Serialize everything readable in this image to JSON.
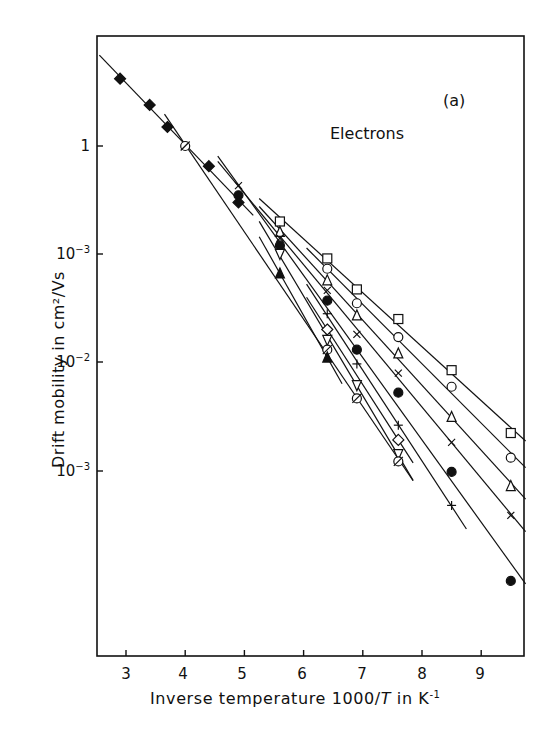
{
  "chart_data": {
    "type": "scatter",
    "title": "",
    "panel_label": "(a)",
    "annotation": "Electrons",
    "xlabel": "Inverse temperature 1000/T in K⁻¹",
    "ylabel": "Drift mobility in cm²/Vs",
    "x_ticks": [
      "3",
      "4",
      "5",
      "6",
      "7",
      "8",
      "9"
    ],
    "y_ticks": [
      "1",
      "10⁻³",
      "10⁻²",
      "10⁻³"
    ],
    "y_scale": "log",
    "xlim": [
      2.6,
      9.8
    ],
    "ylim": [
      3e-05,
      8
    ],
    "grid": false,
    "legend": "none",
    "series": [
      {
        "marker": "open-square",
        "x": [
          5.6,
          6.4,
          6.9,
          7.6,
          8.5,
          9.5
        ],
        "y": [
          0.2,
          0.091,
          0.047,
          0.025,
          0.0084,
          0.0022
        ]
      },
      {
        "marker": "open-circle",
        "x": [
          6.4,
          6.9,
          7.6,
          8.5,
          9.5
        ],
        "y": [
          0.073,
          0.035,
          0.017,
          0.0059,
          0.0013
        ]
      },
      {
        "marker": "open-triangle",
        "x": [
          5.6,
          6.4,
          6.9,
          7.6,
          8.5,
          9.5
        ],
        "y": [
          0.16,
          0.057,
          0.027,
          0.012,
          0.0031,
          0.00071
        ]
      },
      {
        "marker": "cross-x",
        "x": [
          4.9,
          5.6,
          6.4,
          6.9,
          7.6,
          8.5,
          9.5
        ],
        "y": [
          0.43,
          0.14,
          0.046,
          0.018,
          0.0079,
          0.0018,
          0.00038
        ]
      },
      {
        "marker": "filled-circle",
        "x": [
          4.9,
          5.6,
          6.4,
          6.9,
          7.6,
          8.5,
          9.5
        ],
        "y": [
          0.35,
          0.12,
          0.037,
          0.013,
          0.0052,
          0.00096,
          9.4e-05
        ]
      },
      {
        "marker": "plus",
        "x": [
          6.4,
          6.9,
          7.6,
          8.5
        ],
        "y": [
          0.028,
          0.0096,
          0.0026,
          0.00047
        ]
      },
      {
        "marker": "open-diamond",
        "x": [
          6.4,
          7.6
        ],
        "y": [
          0.02,
          0.0019
        ]
      },
      {
        "marker": "open-down-triangle",
        "x": [
          5.6,
          6.4,
          6.9,
          7.6
        ],
        "y": [
          0.1,
          0.016,
          0.0061,
          0.0014
        ]
      },
      {
        "marker": "slashed-circle",
        "x": [
          4.0,
          6.4,
          6.9,
          7.6
        ],
        "y": [
          1.0,
          0.013,
          0.0046,
          0.0012
        ]
      },
      {
        "marker": "filled-triangle",
        "x": [
          5.6,
          6.4
        ],
        "y": [
          0.066,
          0.011
        ]
      },
      {
        "marker": "filled-diamond",
        "x": [
          2.9,
          3.4,
          3.7,
          4.4,
          4.9
        ],
        "y": [
          4.2,
          2.4,
          1.5,
          0.65,
          0.3
        ]
      }
    ]
  },
  "labels": {
    "panel": "(a)",
    "carrier": "Electrons",
    "xlabel_pre": "Inverse temperature 1000/",
    "xlabel_var": "T",
    "xlabel_post": " in K",
    "xlabel_exp": "-1",
    "ylabel": "Drift mobility in cm²/Vs",
    "yticks": [
      {
        "base": "1",
        "exp": ""
      },
      {
        "base": "10",
        "exp": "−3"
      },
      {
        "base": "10",
        "exp": "−2"
      },
      {
        "base": "10",
        "exp": "−3"
      }
    ],
    "xticks": [
      "3",
      "4",
      "5",
      "6",
      "7",
      "8",
      "9"
    ]
  }
}
